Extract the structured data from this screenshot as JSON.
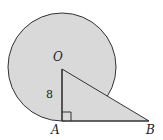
{
  "diagram": {
    "type": "geometry",
    "colors": {
      "fill": "#d9d9d9",
      "stroke": "#333333",
      "background": "#ffffff"
    },
    "labels": {
      "center": "O",
      "point_a": "A",
      "point_b": "B",
      "radius_length": "8"
    }
  }
}
